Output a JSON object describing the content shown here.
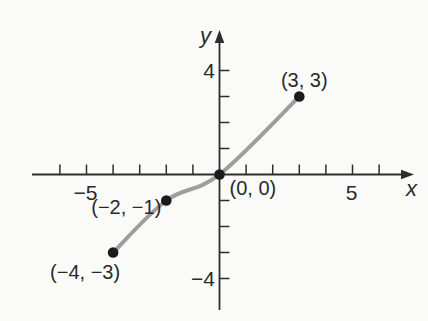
{
  "figure": {
    "background": "#fafaf9"
  },
  "chart_data": {
    "type": "line",
    "title": "",
    "xlabel": "x",
    "ylabel": "y",
    "x_axis": {
      "label": "x",
      "range": [
        -7,
        7.3
      ],
      "ticks": [
        -6,
        -5,
        -4,
        -3,
        -2,
        -1,
        1,
        2,
        3,
        4,
        5,
        6
      ],
      "tick_labels": [
        {
          "value": -5,
          "text": "−5"
        },
        {
          "value": 5,
          "text": "5"
        }
      ]
    },
    "y_axis": {
      "label": "y",
      "range": [
        -5.6,
        5.6
      ],
      "ticks": [
        -4,
        -3,
        -2,
        -1,
        1,
        2,
        3,
        4
      ],
      "tick_labels": [
        {
          "value": 4,
          "text": "4"
        },
        {
          "value": -4,
          "text": "−4"
        }
      ]
    },
    "points": [
      {
        "x": -4,
        "y": -3,
        "label": "(−4, −3)",
        "anchor": "middle",
        "dx": -28,
        "dy": 26
      },
      {
        "x": -2,
        "y": -1,
        "label": "(−2, −1)",
        "anchor": "end",
        "dx": -5,
        "dy": 13
      },
      {
        "x": 0,
        "y": 0,
        "label": "(0, 0)",
        "anchor": "start",
        "dx": 10,
        "dy": 20
      },
      {
        "x": 3,
        "y": 3,
        "label": "(3, 3)",
        "anchor": "middle",
        "dx": 5,
        "dy": -10
      }
    ],
    "style": {
      "curve_color": "#9e9e9e",
      "curve_width": 4,
      "point_color": "#1b1b1b",
      "point_radius": 5.3,
      "axis_color": "#2e2e2e",
      "text_color": "#2a2a2a"
    },
    "legend": null,
    "grid": false
  }
}
